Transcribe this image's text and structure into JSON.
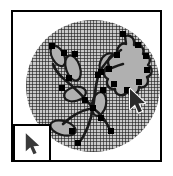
{
  "app": {
    "title": "Vector illustration canvas",
    "document_kind": "drawing-canvas"
  },
  "canvas": {
    "background_label": "crosshatch-circle-fill",
    "hatch_color": "#1e1e1e",
    "hatch_fill_color": "#c9c9c9",
    "page_color": "#ffffff",
    "border_color": "#000000",
    "circle": {
      "cx": 80,
      "cy": 74,
      "rx": 67,
      "ry": 66
    }
  },
  "artwork": {
    "label": "branch-with-leaves-and-flower",
    "stroke_color": "#1a1a1a",
    "leaf_fill_color": "#b0b0b0",
    "anchor_color": "#000000",
    "anchor_size": 6,
    "paths": [
      {
        "name": "main-stem",
        "d": "M 66 131 C 74 120 78 108 80 96 C 82 84 82 72 86 62 C 90 52 98 44 108 38"
      },
      {
        "name": "branch-upper-left",
        "d": "M 80 96 C 72 86 62 76 52 68 C 46 63 42 58 40 52"
      },
      {
        "name": "branch-mid-left",
        "d": "M 80 96 C 70 98 58 104 50 112"
      },
      {
        "name": "branch-lower-right",
        "d": "M 80 96 C 88 102 94 110 98 120"
      },
      {
        "name": "branch-upper-right",
        "d": "M 86 62 C 94 58 102 54 110 52"
      }
    ],
    "leaves": [
      {
        "name": "leaf-top-left",
        "cx": 45,
        "cy": 44,
        "rx": 6,
        "ry": 11,
        "rot": -28
      },
      {
        "name": "leaf-upper-left",
        "cx": 60,
        "cy": 56,
        "rx": 7,
        "ry": 13,
        "rot": -18
      },
      {
        "name": "leaf-center-left",
        "cx": 62,
        "cy": 82,
        "rx": 11,
        "ry": 7,
        "rot": -14
      },
      {
        "name": "leaf-lower-left",
        "cx": 50,
        "cy": 116,
        "rx": 13,
        "ry": 7,
        "rot": 16
      },
      {
        "name": "leaf-center-right",
        "cx": 86,
        "cy": 92,
        "rx": 7,
        "ry": 12,
        "rot": 12
      },
      {
        "name": "leaf-upper-right",
        "cx": 95,
        "cy": 52,
        "rx": 8,
        "ry": 11,
        "rot": 22
      }
    ],
    "flower": {
      "name": "lobed-flower-head",
      "d": "M 112 24 C 118 22 122 27 121 33 C 127 31 132 36 130 42 C 136 42 139 48 135 53 C 140 56 140 63 134 65 C 137 71 132 77 126 75 C 126 82 118 85 114 80 C 110 86 102 83 102 77 C 96 78 92 72 95 67 C 89 64 90 56 96 54 C 93 48 98 41 104 43 C 103 36 108 30 113 32 Z",
      "fill": "#b0b0b0"
    },
    "anchors": [
      {
        "name": "anchor-stem-base",
        "x": 65,
        "y": 131
      },
      {
        "name": "anchor-stem-mid",
        "x": 80,
        "y": 96
      },
      {
        "name": "anchor-stem-upper",
        "x": 85,
        "y": 63
      },
      {
        "name": "anchor-leaf-top-left",
        "x": 39,
        "y": 34
      },
      {
        "name": "anchor-leaf-upper-l1",
        "x": 51,
        "y": 41
      },
      {
        "name": "anchor-leaf-upper-l2",
        "x": 62,
        "y": 42
      },
      {
        "name": "anchor-leaf-upper-l3",
        "x": 56,
        "y": 66
      },
      {
        "name": "anchor-leaf-center-l1",
        "x": 49,
        "y": 76
      },
      {
        "name": "anchor-leaf-center-l2",
        "x": 72,
        "y": 88
      },
      {
        "name": "anchor-leaf-lower-l1",
        "x": 34,
        "y": 122
      },
      {
        "name": "anchor-leaf-lower-l2",
        "x": 59,
        "y": 119
      },
      {
        "name": "anchor-leaf-center-r1",
        "x": 90,
        "y": 78
      },
      {
        "name": "anchor-leaf-center-r2",
        "x": 88,
        "y": 106
      },
      {
        "name": "anchor-branch-lower-r",
        "x": 98,
        "y": 119
      },
      {
        "name": "anchor-leaf-upper-r1",
        "x": 88,
        "y": 60
      },
      {
        "name": "anchor-flower-top",
        "x": 110,
        "y": 22
      },
      {
        "name": "anchor-flower-up-r",
        "x": 125,
        "y": 33
      },
      {
        "name": "anchor-flower-r1",
        "x": 133,
        "y": 44
      },
      {
        "name": "anchor-flower-r2",
        "x": 134,
        "y": 58
      },
      {
        "name": "anchor-flower-br",
        "x": 126,
        "y": 70
      },
      {
        "name": "anchor-flower-b",
        "x": 114,
        "y": 78
      },
      {
        "name": "anchor-flower-bl",
        "x": 101,
        "y": 72
      },
      {
        "name": "anchor-flower-l1",
        "x": 96,
        "y": 57
      },
      {
        "name": "anchor-flower-l2",
        "x": 104,
        "y": 43
      }
    ]
  },
  "pointer": {
    "name": "mouse-cursor",
    "x": 115,
    "y": 76,
    "fill_color": "#2b2b2b",
    "outline_color": "#ffffff"
  },
  "cursor_inset": {
    "name": "magnified-cursor-preview",
    "border_color": "#000000",
    "background_color": "#ffffff",
    "cursor_fill_color": "#3a3a3a",
    "cursor_outline_color": "#ffffff"
  }
}
